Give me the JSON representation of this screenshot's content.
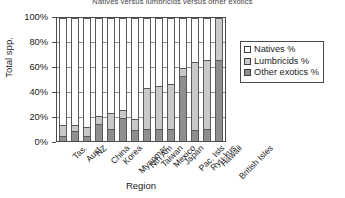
{
  "chart_data": {
    "type": "bar",
    "stacked": true,
    "stack_mode": "percent",
    "title": "Natives versus lumbricids versus other exotics",
    "xlabel": "Region",
    "ylabel": "Total spp.",
    "ylim": [
      0,
      100
    ],
    "yticks": [
      "0%",
      "20%",
      "40%",
      "60%",
      "80%",
      "100%"
    ],
    "ytick_values": [
      0,
      20,
      40,
      60,
      80,
      100
    ],
    "grid": true,
    "legend_position": "right-top",
    "categories": [
      "Tas.",
      "Aust.",
      "NZ",
      "China",
      "Korea",
      "Myanmar",
      "Nth Am",
      "Taiwan",
      "Mexico",
      "Japan",
      "Pac. Isls",
      "Ryu-kus",
      "Hawaii",
      "British Isles"
    ],
    "series": [
      {
        "name": "Other exotics %",
        "color": "#8f8f8f",
        "values": [
          4,
          8,
          4,
          14,
          10,
          19,
          9,
          10,
          10,
          10,
          53,
          9,
          10,
          66
        ]
      },
      {
        "name": "Lumbricids %",
        "color": "#c9c9c9",
        "values": [
          9,
          5,
          7,
          6,
          13,
          6,
          9,
          33,
          35,
          36,
          6,
          55,
          56,
          34
        ]
      },
      {
        "name": "Natives %",
        "color": "#ffffff",
        "values": [
          87,
          87,
          89,
          80,
          77,
          75,
          82,
          57,
          55,
          54,
          41,
          36,
          34,
          0
        ]
      }
    ]
  },
  "legend": {
    "items": [
      {
        "label": "Natives %",
        "swatch": "sw-natives"
      },
      {
        "label": "Lumbricids %",
        "swatch": "sw-lumbricids"
      },
      {
        "label": "Other exotics %",
        "swatch": "sw-other"
      }
    ]
  }
}
